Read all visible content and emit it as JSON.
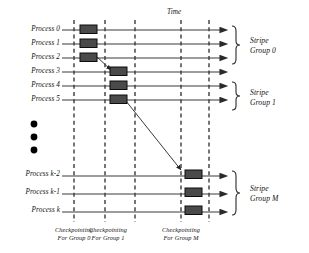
{
  "figure": {
    "title_axis": "Time",
    "processes": [
      {
        "label": "Process 0",
        "y": 30,
        "checkpoint_x": 80,
        "has_checkpoint": true
      },
      {
        "label": "Process 1",
        "y": 44,
        "checkpoint_x": 80,
        "has_checkpoint": true
      },
      {
        "label": "Process 2",
        "y": 58,
        "checkpoint_x": 80,
        "has_checkpoint": true
      },
      {
        "label": "Process 3",
        "y": 72,
        "checkpoint_x": 110,
        "has_checkpoint": true
      },
      {
        "label": "Process 4",
        "y": 86,
        "checkpoint_x": 110,
        "has_checkpoint": true
      },
      {
        "label": "Process 5",
        "y": 100,
        "checkpoint_x": 110,
        "has_checkpoint": true
      },
      {
        "label": "Process k-2",
        "y": 176,
        "checkpoint_x": 185,
        "has_checkpoint": true
      },
      {
        "label": "Process k-1",
        "y": 194,
        "checkpoint_x": 185,
        "has_checkpoint": true
      },
      {
        "label": "Process k",
        "y": 212,
        "checkpoint_x": 185,
        "has_checkpoint": true
      }
    ],
    "checkpoint_lines": [
      {
        "x": 74
      },
      {
        "x": 105
      },
      {
        "x": 135
      },
      {
        "x": 181
      },
      {
        "x": 209
      }
    ],
    "stripe_groups": [
      {
        "label_line1": "Stripe",
        "label_line2": "Group 0",
        "rows": [
          0,
          1,
          2
        ]
      },
      {
        "label_line1": "Stripe",
        "label_line2": "Group 1",
        "rows": [
          3,
          4,
          5
        ]
      },
      {
        "label_line1": "Stripe",
        "label_line2": "Group M",
        "rows": [
          6,
          7,
          8
        ]
      }
    ],
    "captions": [
      {
        "line1": "Checkpointing",
        "line2": "For Group 0",
        "x": 74
      },
      {
        "line1": "Checkpointing",
        "line2": "For Group 1",
        "x": 105
      },
      {
        "line1": "Checkpointing",
        "line2": "For Group M",
        "x": 181
      }
    ],
    "dependency_arrows": [
      {
        "name": "arrow-p2-to-p3",
        "x1": 96,
        "y1": 57,
        "x2": 110,
        "y2": 71
      },
      {
        "name": "arrow-p5-to-pk2",
        "x1": 126,
        "y1": 101,
        "x2": 180,
        "y2": 172
      }
    ],
    "ellipsis_dots": [
      {
        "cx": 34,
        "cy": 124
      },
      {
        "cx": 34,
        "cy": 137
      },
      {
        "cx": 34,
        "cy": 150
      }
    ],
    "colors": {
      "line": "#3a3a3a",
      "dashed": "#2b2b2b",
      "checkpoint_fill": "#4a4a4a",
      "checkpoint_stroke": "#101010",
      "arrow": "#222222",
      "text": "#111111",
      "background": "#ffffff"
    },
    "geometry": {
      "axis_start_x": 62,
      "axis_end_x": 227,
      "checkpoint_width": 16,
      "checkpoint_height": 8
    }
  }
}
